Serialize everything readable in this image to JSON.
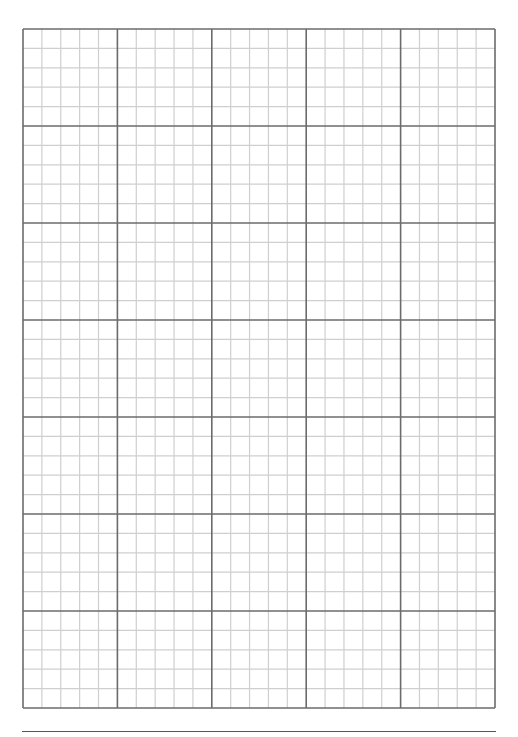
{
  "document": {
    "type": "graph-paper",
    "grid": {
      "major_columns": 5,
      "major_rows": 7,
      "minor_per_major": 5,
      "major_line_color": "#6b6b6b",
      "minor_line_color": "#cfcfcf"
    },
    "footer": {
      "rule_color": "#555555",
      "text": ""
    }
  }
}
